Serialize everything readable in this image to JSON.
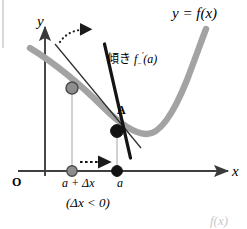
{
  "figure": {
    "kind": "calculus-derivative-diagram",
    "width": 247,
    "height": 229,
    "background_color": "#ffffff"
  },
  "colors": {
    "curve": "#a0a0a0",
    "tangent": "#1a1a1a",
    "secant": "#3a3a3a",
    "axis": "#4a4a4a",
    "point_a_fill": "#111111",
    "point_moving_fill": "#8e8e8e",
    "point_moving_stroke": "#4a4a4a",
    "drop_line": "#b5b5b5",
    "dotted_arrow": "#1a1a1a",
    "page_border": "#cfcfcf",
    "faint_text": "#c9c9c9"
  },
  "labels": {
    "curve_name": "y = f(x)",
    "curve_name_parts": {
      "lhs": "y",
      "eq": " = ",
      "fn": "f",
      "arg": "(x)"
    },
    "y_axis": "y",
    "x_axis": "x",
    "origin": "O",
    "point_a": "A",
    "slope_prefix": "傾き",
    "slope_function": "f",
    "slope_subscript": "−",
    "slope_prime": "′",
    "slope_argument": "(a)",
    "slope_full": "傾き f−′(a)",
    "tick_a_plus_delta": "a + Δx",
    "tick_a": "a",
    "condition": "(Δx < 0)",
    "corner_fragment": "f(x)"
  },
  "geometry": {
    "axes": {
      "x_axis": {
        "x1": 18,
        "y1": 171,
        "x2": 230,
        "y2": 171,
        "arrow": "right"
      },
      "y_axis": {
        "x1": 45,
        "y1": 175,
        "x2": 45,
        "y2": 25,
        "arrow": "up"
      }
    },
    "curve_path": "M 32,50 C 58,66 84,86 106,108 C 122,124 134,133 146,134 C 160,135 174,112 186,82 C 194,61 200,43 205,30",
    "point_a": {
      "x": 117,
      "y": 131,
      "radius": 6.2
    },
    "point_moving_on_curve": {
      "x": 72,
      "y": 88,
      "radius": 6.0
    },
    "point_a_on_axis": {
      "x": 117,
      "y": 171,
      "radius": 5.2
    },
    "point_moving_on_axis": {
      "x": 72,
      "y": 171,
      "radius": 5.2
    },
    "tangent_line": {
      "x1": 104,
      "y1": 46,
      "x2": 130,
      "y2": 156
    },
    "secant_line": {
      "x1": 57,
      "y1": 48,
      "x2": 139,
      "y2": 146
    },
    "drop_line_a": {
      "x": 117,
      "y1": 131,
      "y2": 171
    },
    "drop_line_moving": {
      "x": 72,
      "y1": 88,
      "y2": 171
    },
    "dotted_horizontal_arrow": {
      "x1": 80,
      "y1": 162,
      "x2": 112,
      "y2": 162
    },
    "dotted_rotation_arrow": {
      "from_x": 62,
      "from_y": 40,
      "to_x": 88,
      "to_y": 32
    },
    "page_border_line": {
      "x": 3,
      "y1": 0,
      "y2": 50
    }
  },
  "annotations": {
    "meaning": "Left-hand derivative: secant through (a+Δx, f(a+Δx)) rotates toward the tangent at A as Δx → 0 from below."
  }
}
